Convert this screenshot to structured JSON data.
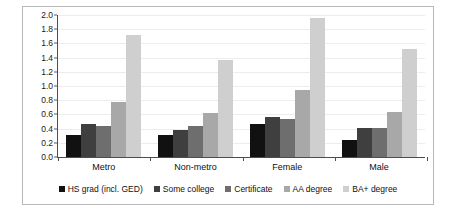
{
  "chart_data": {
    "type": "bar",
    "title": "",
    "subtitle": "",
    "xlabel": "",
    "ylabel": "",
    "ylim": [
      0.0,
      2.0
    ],
    "ytick_labels": [
      "0.0",
      "0.2",
      "0.4",
      "0.6",
      "0.8",
      "1.0",
      "1.2",
      "1.4",
      "1.6",
      "1.8",
      "2.0"
    ],
    "ytick_values": [
      0.0,
      0.2,
      0.4,
      0.6,
      0.8,
      1.0,
      1.2,
      1.4,
      1.6,
      1.8,
      2.0
    ],
    "grid": true,
    "grid_axis": "y",
    "legend_position": "bottom",
    "categories": [
      "Metro",
      "Non-metro",
      "Female",
      "Male"
    ],
    "series": [
      {
        "name": "HS grad (incl. GED)",
        "color": "#111111",
        "values": [
          0.31,
          0.31,
          0.46,
          0.24
        ]
      },
      {
        "name": "Some college",
        "color": "#3f3f3f",
        "values": [
          0.47,
          0.385,
          0.56,
          0.41
        ]
      },
      {
        "name": "Certificate",
        "color": "#6e6e6e",
        "values": [
          0.44,
          0.44,
          0.53,
          0.41
        ]
      },
      {
        "name": "AA degree",
        "color": "#a8a8a8",
        "values": [
          0.77,
          0.62,
          0.95,
          0.64
        ]
      },
      {
        "name": "BA+ degree",
        "color": "#cfcfcf",
        "values": [
          1.72,
          1.36,
          1.96,
          1.52
        ]
      }
    ]
  },
  "colors": {
    "frame_border": "#b8b8b8",
    "background": "#ffffff",
    "axis": "#4d4d4d",
    "gridline": "#ededed",
    "text": "#111111"
  }
}
